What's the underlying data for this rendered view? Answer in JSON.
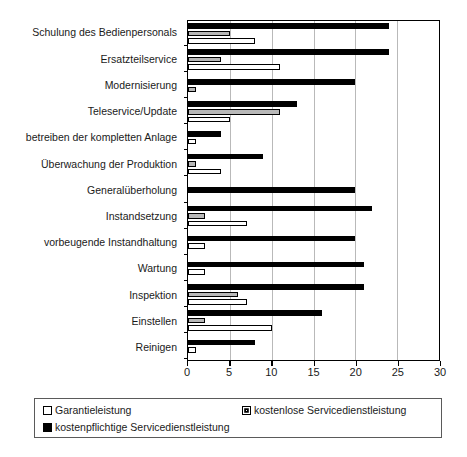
{
  "chart_data": {
    "type": "bar",
    "orientation": "horizontal",
    "title": "",
    "xlabel": "",
    "ylabel": "",
    "xlim": [
      0,
      30
    ],
    "xticks": [
      0,
      5,
      10,
      15,
      20,
      25,
      30
    ],
    "xtick_labels": [
      "0",
      "5",
      "10",
      "15",
      "20",
      "25",
      "30"
    ],
    "grid": true,
    "legend_position": "bottom",
    "categories": [
      "Schulung des Bedienpersonals",
      "Ersatzteilservice",
      "Modernisierung",
      "Teleservice/Update",
      "betreiben der kompletten Anlage",
      "Überwachung der Produktion",
      "Generalüberholung",
      "Instandsetzung",
      "vorbeugende Instandhaltung",
      "Wartung",
      "Inspektion",
      "Einstellen",
      "Reinigen"
    ],
    "series": [
      {
        "name": "kostenpflichtige Servicedienstleistung",
        "color": "#000000",
        "style": "filled-black",
        "values": [
          24,
          24,
          20,
          13,
          4,
          9,
          20,
          22,
          20,
          21,
          21,
          16,
          8
        ]
      },
      {
        "name": "kostenlose Servicedienstleistung",
        "color": "#b8b8b8",
        "style": "filled-gray",
        "values": [
          5,
          4,
          1,
          11,
          0,
          1,
          0,
          2,
          0,
          0,
          6,
          2,
          0
        ]
      },
      {
        "name": "Garantieleistung",
        "color": "#ffffff",
        "style": "outline-white",
        "values": [
          8,
          11,
          0,
          5,
          1,
          4,
          0,
          7,
          2,
          2,
          7,
          10,
          1
        ]
      }
    ]
  },
  "legend": {
    "items": [
      {
        "label": "Garantieleistung",
        "swatch": "white"
      },
      {
        "label": "kostenlose Servicedienstleistung",
        "swatch": "gray"
      },
      {
        "label": "kostenpflichtige Servicedienstleistung",
        "swatch": "black"
      }
    ]
  }
}
